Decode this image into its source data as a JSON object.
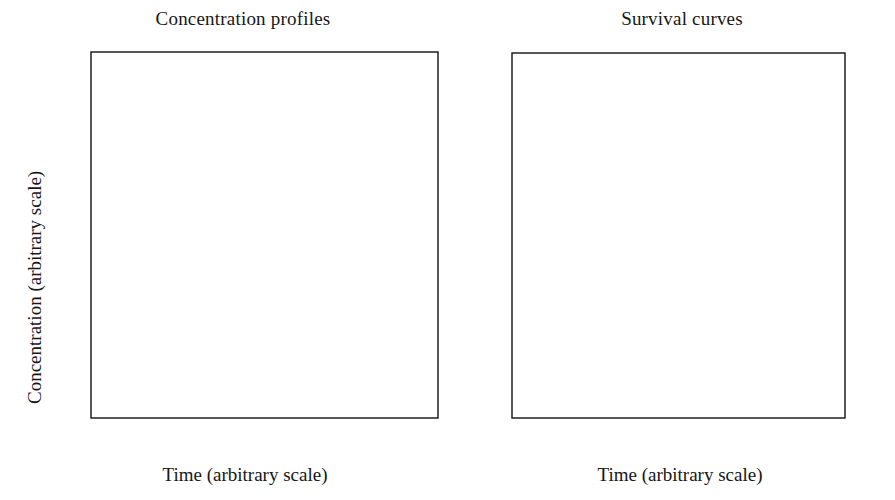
{
  "figure": {
    "background": "#ffffff",
    "ink": "#111111",
    "width": 895,
    "height": 500
  },
  "chart_data": [
    {
      "type": "line",
      "panel": "left",
      "title": "Concentration profiles",
      "xlabel": "Time (arbitrary scale)",
      "ylabel": "Concentration (arbitrary scale)",
      "xlim": [
        0,
        30
      ],
      "ylim": [
        0,
        5
      ],
      "xticks": [
        0,
        5,
        10,
        15,
        20,
        25,
        30
      ],
      "yticks": [
        0,
        1,
        2,
        3,
        4,
        5
      ],
      "xticklabels": [
        "0",
        "5",
        "10",
        "15",
        "20",
        "25",
        "30"
      ],
      "yticklabels": [
        "0",
        "1",
        "2",
        "3",
        "4",
        "5"
      ],
      "grid": false,
      "legend": "inline-annotations",
      "annotations": [
        {
          "text": "A",
          "x": 14.0,
          "y": 3.63
        },
        {
          "text": "B",
          "x": 10.0,
          "y": 2.05
        }
      ],
      "series": [
        {
          "name": "A",
          "label": "A",
          "color": "#111111",
          "description": "Staircase decay with plateaus near 4.4, 2.25 and 1.45",
          "points": [
            [
              0.0,
              5.0
            ],
            [
              1.2,
              5.0
            ],
            [
              2.0,
              4.97
            ],
            [
              2.6,
              4.9
            ],
            [
              3.2,
              4.76
            ],
            [
              3.8,
              4.6
            ],
            [
              4.4,
              4.49
            ],
            [
              5.0,
              4.43
            ],
            [
              6.0,
              4.41
            ],
            [
              7.5,
              4.4
            ],
            [
              8.6,
              4.4
            ],
            [
              9.4,
              4.37
            ],
            [
              10.2,
              4.28
            ],
            [
              11.0,
              4.12
            ],
            [
              11.8,
              3.93
            ],
            [
              12.6,
              3.76
            ],
            [
              13.4,
              3.62
            ],
            [
              14.2,
              3.53
            ],
            [
              15.0,
              3.48
            ],
            [
              15.8,
              3.44
            ],
            [
              16.4,
              3.34
            ],
            [
              17.0,
              3.12
            ],
            [
              17.6,
              2.8
            ],
            [
              18.2,
              2.48
            ],
            [
              18.8,
              2.3
            ],
            [
              19.4,
              2.24
            ],
            [
              20.2,
              2.23
            ],
            [
              21.0,
              2.21
            ],
            [
              21.6,
              2.11
            ],
            [
              22.2,
              1.87
            ],
            [
              22.8,
              1.64
            ],
            [
              23.4,
              1.51
            ],
            [
              24.0,
              1.45
            ],
            [
              24.8,
              1.42
            ],
            [
              25.4,
              1.3
            ],
            [
              26.0,
              1.08
            ],
            [
              26.6,
              0.82
            ],
            [
              27.2,
              0.56
            ],
            [
              27.8,
              0.34
            ],
            [
              28.4,
              0.18
            ],
            [
              29.0,
              0.07
            ],
            [
              29.5,
              0.02
            ],
            [
              30.0,
              0.0
            ]
          ]
        },
        {
          "name": "B",
          "label": "B",
          "color": "#111111",
          "description": "Staircase decay shifted earlier, plateaus near 4.4, 3.15 and 0.8",
          "points": [
            [
              0.0,
              5.0
            ],
            [
              1.0,
              5.0
            ],
            [
              1.8,
              4.97
            ],
            [
              2.4,
              4.88
            ],
            [
              3.0,
              4.72
            ],
            [
              3.6,
              4.58
            ],
            [
              4.2,
              4.48
            ],
            [
              4.8,
              4.42
            ],
            [
              5.4,
              4.36
            ],
            [
              6.0,
              4.22
            ],
            [
              6.6,
              3.99
            ],
            [
              7.2,
              3.72
            ],
            [
              7.8,
              3.48
            ],
            [
              8.4,
              3.3
            ],
            [
              9.0,
              3.2
            ],
            [
              9.6,
              3.16
            ],
            [
              10.2,
              3.12
            ],
            [
              10.8,
              3.02
            ],
            [
              11.4,
              2.8
            ],
            [
              12.0,
              2.5
            ],
            [
              12.6,
              2.18
            ],
            [
              13.2,
              1.85
            ],
            [
              13.8,
              1.55
            ],
            [
              14.4,
              1.28
            ],
            [
              15.0,
              1.05
            ],
            [
              15.6,
              0.9
            ],
            [
              16.2,
              0.82
            ],
            [
              16.8,
              0.79
            ],
            [
              17.6,
              0.78
            ],
            [
              18.2,
              0.76
            ],
            [
              18.8,
              0.66
            ],
            [
              19.4,
              0.44
            ],
            [
              20.0,
              0.22
            ],
            [
              20.6,
              0.08
            ],
            [
              21.2,
              0.02
            ],
            [
              22.0,
              0.0
            ],
            [
              30.0,
              0.0
            ]
          ]
        }
      ]
    },
    {
      "type": "line",
      "panel": "right",
      "title": "Survival curves",
      "xlabel": "Time (arbitrary scale)",
      "ylabel": "Log S(t)",
      "xlim": [
        0,
        30
      ],
      "ylim": [
        -6,
        0
      ],
      "xticks": [
        0,
        5,
        10,
        15,
        20,
        25,
        30
      ],
      "yticks": [
        0,
        -1,
        -2,
        -3,
        -4,
        -5,
        -6
      ],
      "xticklabels": [
        "0",
        "5",
        "10",
        "15",
        "20",
        "25",
        "30"
      ],
      "yticklabels": [
        "0",
        "−1",
        "−2",
        "−3",
        "−4",
        "−5",
        "−6"
      ],
      "grid": false,
      "legend": "inline-annotations",
      "annotations": [
        {
          "text": "B",
          "x": 14.2,
          "y": -2.26
        },
        {
          "text": "A",
          "x": 13.9,
          "y": -3.52
        }
      ],
      "series": [
        {
          "name": "A",
          "label": "A",
          "color": "#111111",
          "description": "Steeper sigmoidal decline levelling near -5.85",
          "points": [
            [
              0.0,
              -0.03
            ],
            [
              1.0,
              -0.08
            ],
            [
              2.0,
              -0.2
            ],
            [
              3.0,
              -0.4
            ],
            [
              4.0,
              -0.64
            ],
            [
              5.0,
              -0.92
            ],
            [
              6.0,
              -1.22
            ],
            [
              7.0,
              -1.55
            ],
            [
              8.0,
              -1.9
            ],
            [
              9.0,
              -2.25
            ],
            [
              10.0,
              -2.6
            ],
            [
              11.0,
              -2.95
            ],
            [
              12.0,
              -3.28
            ],
            [
              13.0,
              -3.6
            ],
            [
              14.0,
              -3.9
            ],
            [
              15.0,
              -4.18
            ],
            [
              16.0,
              -4.44
            ],
            [
              17.0,
              -4.67
            ],
            [
              18.0,
              -4.88
            ],
            [
              19.0,
              -5.06
            ],
            [
              20.0,
              -5.22
            ],
            [
              21.0,
              -5.36
            ],
            [
              22.0,
              -5.48
            ],
            [
              23.0,
              -5.58
            ],
            [
              24.0,
              -5.66
            ],
            [
              25.0,
              -5.72
            ],
            [
              26.0,
              -5.77
            ],
            [
              27.0,
              -5.8
            ],
            [
              28.0,
              -5.83
            ],
            [
              29.0,
              -5.84
            ],
            [
              30.0,
              -5.85
            ]
          ]
        },
        {
          "name": "B",
          "label": "B",
          "color": "#111111",
          "description": "Declines then saturates at a plateau of -2.9 from t≈19",
          "points": [
            [
              0.0,
              -0.03
            ],
            [
              1.0,
              -0.08
            ],
            [
              2.0,
              -0.2
            ],
            [
              3.0,
              -0.4
            ],
            [
              4.0,
              -0.64
            ],
            [
              5.0,
              -0.92
            ],
            [
              6.0,
              -1.2
            ],
            [
              7.0,
              -1.48
            ],
            [
              8.0,
              -1.72
            ],
            [
              9.0,
              -1.94
            ],
            [
              10.0,
              -2.12
            ],
            [
              11.0,
              -2.28
            ],
            [
              12.0,
              -2.42
            ],
            [
              13.0,
              -2.54
            ],
            [
              14.0,
              -2.64
            ],
            [
              15.0,
              -2.72
            ],
            [
              16.0,
              -2.79
            ],
            [
              17.0,
              -2.84
            ],
            [
              18.0,
              -2.88
            ],
            [
              19.0,
              -2.9
            ],
            [
              20.0,
              -2.9
            ],
            [
              22.0,
              -2.9
            ],
            [
              25.0,
              -2.9
            ],
            [
              28.0,
              -2.9
            ],
            [
              30.0,
              -2.9
            ]
          ]
        }
      ]
    }
  ]
}
